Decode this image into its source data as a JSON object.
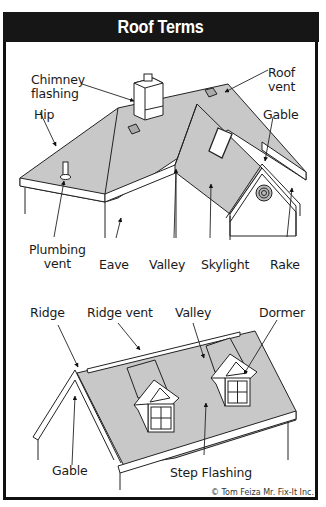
{
  "header": {
    "title": "Roof Terms",
    "bg_color": "#161616",
    "text_color": "#ffffff"
  },
  "colors": {
    "roof_fill": "#c8c8c8",
    "line": "#222222",
    "frame": "#111111"
  },
  "diagram_top": {
    "labels": {
      "chimney_flashing_1": "Chimney",
      "chimney_flashing_2": "flashing",
      "roof_vent_1": "Roof",
      "roof_vent_2": "vent",
      "hip": "Hip",
      "gable": "Gable",
      "plumbing_vent_1": "Plumbing",
      "plumbing_vent_2": "vent",
      "eave": "Eave",
      "valley": "Valley",
      "skylight": "Skylight",
      "rake": "Rake"
    }
  },
  "diagram_bottom": {
    "labels": {
      "ridge": "Ridge",
      "ridge_vent": "Ridge vent",
      "valley": "Valley",
      "dormer": "Dormer",
      "gable": "Gable",
      "step_flashing": "Step Flashing"
    }
  },
  "credit": "© Tom Feiza Mr. Fix-It Inc."
}
